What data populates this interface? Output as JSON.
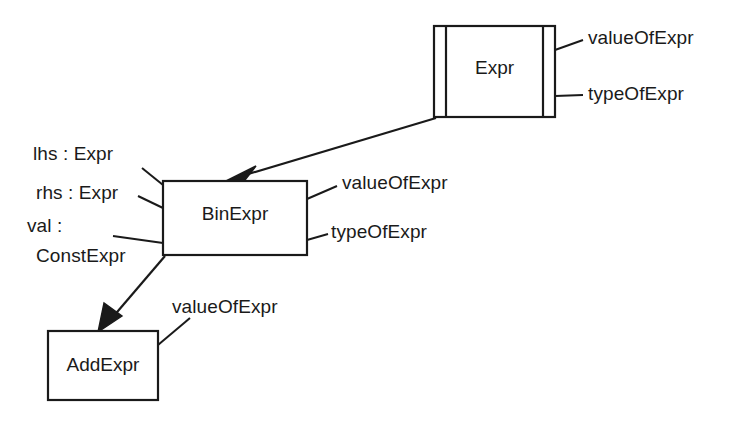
{
  "diagram": {
    "kind": "uml-class-diagram",
    "stroke_color": "#1a1a1a",
    "fill_color": "#ffffff",
    "background": "#ffffff",
    "classes": [
      {
        "id": "expr",
        "name": "Expr",
        "abstract": true,
        "notation": "double-bar-sides",
        "members": [
          "valueOfExpr",
          "typeOfExpr"
        ]
      },
      {
        "id": "binexpr",
        "name": "BinExpr",
        "abstract": false,
        "notation": "plain-rectangle",
        "attributes": [
          "lhs : Expr",
          "rhs : Expr",
          "val :",
          "ConstExpr"
        ],
        "members": [
          "valueOfExpr",
          "typeOfExpr"
        ]
      },
      {
        "id": "addexpr",
        "name": "AddExpr",
        "abstract": false,
        "notation": "plain-rectangle",
        "members": [
          "valueOfExpr"
        ]
      }
    ],
    "relations": [
      {
        "from": "expr",
        "to": "binexpr",
        "type": "inheritance",
        "arrowhead": "filled-triangle"
      },
      {
        "from": "binexpr",
        "to": "addexpr",
        "type": "inheritance",
        "arrowhead": "filled-triangle"
      }
    ]
  },
  "labels": {
    "expr_box_title": "Expr",
    "expr_value_of": "valueOfExpr",
    "expr_type_of": "typeOfExpr",
    "binexpr_box_title": "BinExpr",
    "binexpr_lhs": "lhs : Expr",
    "binexpr_rhs": "rhs : Expr",
    "binexpr_val": "val :",
    "binexpr_val_type": "ConstExpr",
    "binexpr_value_of": "valueOfExpr",
    "binexpr_type_of": "typeOfExpr",
    "addexpr_box_title": "AddExpr",
    "addexpr_value_of": "valueOfExpr"
  }
}
